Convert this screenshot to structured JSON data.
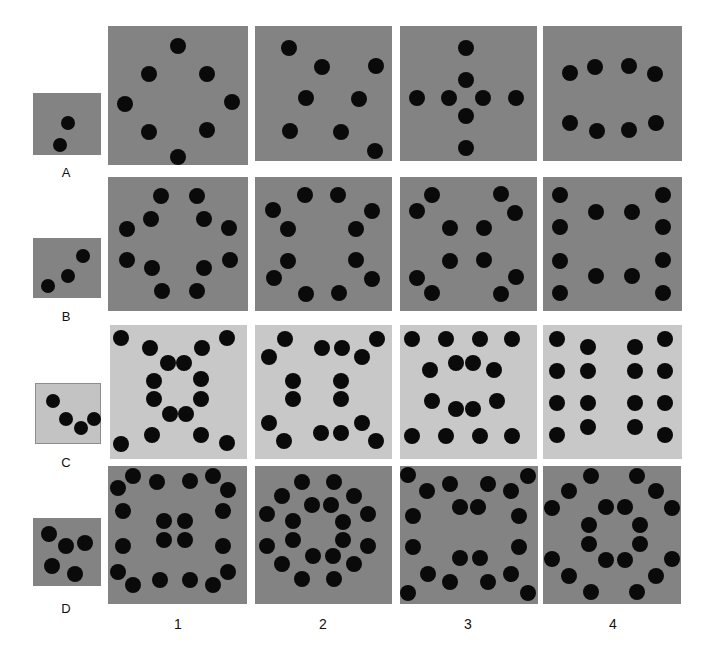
{
  "figure": {
    "width": 706,
    "height": 649,
    "background": "#ffffff",
    "dot_color": "#0a0a0a"
  },
  "row_labels": [
    {
      "id": "A",
      "label": "A",
      "x": 66,
      "y": 166
    },
    {
      "id": "B",
      "label": "B",
      "x": 66,
      "y": 310
    },
    {
      "id": "C",
      "label": "C",
      "x": 66,
      "y": 456
    },
    {
      "id": "D",
      "label": "D",
      "x": 66,
      "y": 602
    }
  ],
  "col_labels": [
    {
      "id": "1",
      "label": "1",
      "x": 178,
      "y": 617
    },
    {
      "id": "2",
      "label": "2",
      "x": 323,
      "y": 617
    },
    {
      "id": "3",
      "label": "3",
      "x": 468,
      "y": 617
    },
    {
      "id": "4",
      "label": "4",
      "x": 613,
      "y": 617
    }
  ],
  "panels": [
    {
      "id": "A-sample",
      "row": "A",
      "col": "sample",
      "x": 33,
      "y": 93,
      "w": 68,
      "h": 62,
      "bg": "#838383",
      "border": "none",
      "dot_r": 7,
      "count": 2,
      "dots": [
        [
          35,
          30
        ],
        [
          27,
          52
        ]
      ]
    },
    {
      "id": "A1",
      "row": "A",
      "col": "1",
      "x": 108,
      "y": 26,
      "w": 140,
      "h": 139,
      "bg": "#838383",
      "border": "none",
      "dot_r": 8,
      "count": 8,
      "dots": [
        [
          70,
          20
        ],
        [
          41,
          48
        ],
        [
          99,
          48
        ],
        [
          17,
          78
        ],
        [
          124,
          76
        ],
        [
          41,
          106
        ],
        [
          99,
          104
        ],
        [
          70,
          131
        ]
      ]
    },
    {
      "id": "A2",
      "row": "A",
      "col": "2",
      "x": 255,
      "y": 26,
      "w": 137,
      "h": 135,
      "bg": "#838383",
      "border": "none",
      "dot_r": 8,
      "count": 8,
      "dots": [
        [
          34,
          22
        ],
        [
          67,
          41
        ],
        [
          121,
          40
        ],
        [
          51,
          72
        ],
        [
          104,
          73
        ],
        [
          35,
          105
        ],
        [
          86,
          106
        ],
        [
          120,
          125
        ]
      ]
    },
    {
      "id": "A3",
      "row": "A",
      "col": "3",
      "x": 400,
      "y": 26,
      "w": 137,
      "h": 135,
      "bg": "#838383",
      "border": "none",
      "dot_r": 8,
      "count": 8,
      "dots": [
        [
          66,
          22
        ],
        [
          66,
          54
        ],
        [
          17,
          72
        ],
        [
          49,
          72
        ],
        [
          83,
          72
        ],
        [
          116,
          72
        ],
        [
          66,
          90
        ],
        [
          66,
          122
        ]
      ]
    },
    {
      "id": "A4",
      "row": "A",
      "col": "4",
      "x": 543,
      "y": 26,
      "w": 139,
      "h": 135,
      "bg": "#838383",
      "border": "none",
      "dot_r": 8,
      "count": 8,
      "dots": [
        [
          27,
          47
        ],
        [
          52,
          41
        ],
        [
          86,
          40
        ],
        [
          112,
          48
        ],
        [
          27,
          97
        ],
        [
          54,
          105
        ],
        [
          86,
          104
        ],
        [
          113,
          97
        ]
      ]
    },
    {
      "id": "B-sample",
      "row": "B",
      "col": "sample",
      "x": 33,
      "y": 238,
      "w": 68,
      "h": 60,
      "bg": "#838383",
      "border": "none",
      "dot_r": 7,
      "count": 3,
      "dots": [
        [
          50,
          18
        ],
        [
          35,
          38
        ],
        [
          15,
          48
        ]
      ]
    },
    {
      "id": "B1",
      "row": "B",
      "col": "1",
      "x": 108,
      "y": 177,
      "w": 140,
      "h": 134,
      "bg": "#838383",
      "border": "none",
      "dot_r": 8,
      "count": 12,
      "dots": [
        [
          53,
          19
        ],
        [
          89,
          19
        ],
        [
          43,
          42
        ],
        [
          96,
          42
        ],
        [
          19,
          52
        ],
        [
          121,
          51
        ],
        [
          19,
          83
        ],
        [
          122,
          83
        ],
        [
          44,
          91
        ],
        [
          96,
          91
        ],
        [
          54,
          114
        ],
        [
          89,
          114
        ]
      ]
    },
    {
      "id": "B2",
      "row": "B",
      "col": "2",
      "x": 255,
      "y": 177,
      "w": 137,
      "h": 134,
      "bg": "#838383",
      "border": "none",
      "dot_r": 8,
      "count": 12,
      "dots": [
        [
          50,
          18
        ],
        [
          83,
          18
        ],
        [
          18,
          33
        ],
        [
          117,
          34
        ],
        [
          33,
          52
        ],
        [
          101,
          52
        ],
        [
          33,
          84
        ],
        [
          101,
          83
        ],
        [
          19,
          101
        ],
        [
          117,
          102
        ],
        [
          51,
          117
        ],
        [
          84,
          116
        ]
      ]
    },
    {
      "id": "B3",
      "row": "B",
      "col": "3",
      "x": 400,
      "y": 177,
      "w": 137,
      "h": 134,
      "bg": "#838383",
      "border": "none",
      "dot_r": 8,
      "count": 12,
      "dots": [
        [
          32,
          18
        ],
        [
          101,
          17
        ],
        [
          17,
          34
        ],
        [
          115,
          36
        ],
        [
          50,
          51
        ],
        [
          84,
          51
        ],
        [
          50,
          84
        ],
        [
          84,
          83
        ],
        [
          17,
          101
        ],
        [
          116,
          100
        ],
        [
          32,
          116
        ],
        [
          101,
          117
        ]
      ]
    },
    {
      "id": "B4",
      "row": "B",
      "col": "4",
      "x": 543,
      "y": 177,
      "w": 139,
      "h": 134,
      "bg": "#838383",
      "border": "none",
      "dot_r": 8,
      "count": 12,
      "dots": [
        [
          17,
          18
        ],
        [
          120,
          18
        ],
        [
          53,
          35
        ],
        [
          89,
          35
        ],
        [
          17,
          50
        ],
        [
          120,
          50
        ],
        [
          17,
          84
        ],
        [
          120,
          83
        ],
        [
          53,
          99
        ],
        [
          89,
          99
        ],
        [
          17,
          116
        ],
        [
          120,
          116
        ]
      ]
    },
    {
      "id": "C-sample",
      "row": "C",
      "col": "sample",
      "x": 35,
      "y": 383,
      "w": 66,
      "h": 61,
      "bg": "#c3c3c3",
      "border": "1px solid #8d8d8d",
      "dot_r": 7,
      "count": 4,
      "dots": [
        [
          17,
          17
        ],
        [
          30,
          35
        ],
        [
          45,
          44
        ],
        [
          58,
          35
        ]
      ]
    },
    {
      "id": "C1",
      "row": "C",
      "col": "1",
      "x": 110,
      "y": 325,
      "w": 137,
      "h": 134,
      "bg": "#c8c8c8",
      "border": "none",
      "dot_r": 8,
      "count": 16,
      "dots": [
        [
          11,
          13
        ],
        [
          40,
          23
        ],
        [
          58,
          38
        ],
        [
          74,
          38
        ],
        [
          92,
          23
        ],
        [
          117,
          13
        ],
        [
          44,
          56
        ],
        [
          91,
          54
        ],
        [
          44,
          74
        ],
        [
          91,
          74
        ],
        [
          60,
          89
        ],
        [
          76,
          89
        ],
        [
          11,
          119
        ],
        [
          42,
          110
        ],
        [
          91,
          110
        ],
        [
          117,
          118
        ]
      ]
    },
    {
      "id": "C2",
      "row": "C",
      "col": "2",
      "x": 255,
      "y": 325,
      "w": 137,
      "h": 134,
      "bg": "#c8c8c8",
      "border": "none",
      "dot_r": 8,
      "count": 16,
      "dots": [
        [
          30,
          14
        ],
        [
          67,
          23
        ],
        [
          87,
          23
        ],
        [
          122,
          14
        ],
        [
          14,
          32
        ],
        [
          107,
          32
        ],
        [
          38,
          56
        ],
        [
          86,
          56
        ],
        [
          38,
          74
        ],
        [
          86,
          74
        ],
        [
          14,
          98
        ],
        [
          107,
          98
        ],
        [
          29,
          116
        ],
        [
          66,
          108
        ],
        [
          86,
          108
        ],
        [
          121,
          116
        ]
      ]
    },
    {
      "id": "C3",
      "row": "C",
      "col": "3",
      "x": 400,
      "y": 325,
      "w": 137,
      "h": 134,
      "bg": "#c8c8c8",
      "border": "none",
      "dot_r": 8,
      "count": 16,
      "dots": [
        [
          12,
          14
        ],
        [
          46,
          14
        ],
        [
          80,
          14
        ],
        [
          112,
          14
        ],
        [
          56,
          38
        ],
        [
          73,
          38
        ],
        [
          30,
          45
        ],
        [
          94,
          45
        ],
        [
          32,
          76
        ],
        [
          97,
          76
        ],
        [
          56,
          84
        ],
        [
          73,
          84
        ],
        [
          12,
          111
        ],
        [
          46,
          111
        ],
        [
          80,
          111
        ],
        [
          112,
          111
        ]
      ]
    },
    {
      "id": "C4",
      "row": "C",
      "col": "4",
      "x": 543,
      "y": 325,
      "w": 139,
      "h": 134,
      "bg": "#c8c8c8",
      "border": "none",
      "dot_r": 8,
      "count": 16,
      "dots": [
        [
          14,
          14
        ],
        [
          45,
          22
        ],
        [
          92,
          22
        ],
        [
          122,
          14
        ],
        [
          14,
          46
        ],
        [
          45,
          46
        ],
        [
          92,
          46
        ],
        [
          122,
          46
        ],
        [
          14,
          78
        ],
        [
          45,
          78
        ],
        [
          92,
          78
        ],
        [
          122,
          78
        ],
        [
          14,
          110
        ],
        [
          45,
          102
        ],
        [
          92,
          102
        ],
        [
          122,
          110
        ]
      ]
    },
    {
      "id": "D-sample",
      "row": "D",
      "col": "sample",
      "x": 33,
      "y": 518,
      "w": 68,
      "h": 68,
      "bg": "#838383",
      "border": "none",
      "dot_r": 8,
      "count": 5,
      "dots": [
        [
          16,
          16
        ],
        [
          33,
          28
        ],
        [
          52,
          25
        ],
        [
          19,
          48
        ],
        [
          42,
          56
        ]
      ]
    },
    {
      "id": "D1",
      "row": "D",
      "col": "1",
      "x": 108,
      "y": 466,
      "w": 139,
      "h": 138,
      "bg": "#838383",
      "border": "none",
      "dot_r": 8,
      "count": 20,
      "dots": [
        [
          25,
          10
        ],
        [
          49,
          16
        ],
        [
          82,
          15
        ],
        [
          105,
          10
        ],
        [
          10,
          22
        ],
        [
          120,
          24
        ],
        [
          15,
          45
        ],
        [
          115,
          45
        ],
        [
          56,
          55
        ],
        [
          77,
          55
        ],
        [
          56,
          74
        ],
        [
          77,
          74
        ],
        [
          15,
          80
        ],
        [
          115,
          80
        ],
        [
          10,
          106
        ],
        [
          120,
          106
        ],
        [
          25,
          119
        ],
        [
          52,
          114
        ],
        [
          82,
          114
        ],
        [
          105,
          119
        ]
      ]
    },
    {
      "id": "D2",
      "row": "D",
      "col": "2",
      "x": 255,
      "y": 466,
      "w": 137,
      "h": 138,
      "bg": "#838383",
      "border": "none",
      "dot_r": 8,
      "count": 20,
      "dots": [
        [
          47,
          16
        ],
        [
          79,
          16
        ],
        [
          27,
          30
        ],
        [
          99,
          30
        ],
        [
          57,
          39
        ],
        [
          76,
          39
        ],
        [
          12,
          48
        ],
        [
          113,
          48
        ],
        [
          38,
          55
        ],
        [
          88,
          56
        ],
        [
          12,
          80
        ],
        [
          113,
          80
        ],
        [
          38,
          74
        ],
        [
          88,
          74
        ],
        [
          58,
          90
        ],
        [
          78,
          90
        ],
        [
          27,
          98
        ],
        [
          99,
          98
        ],
        [
          47,
          113
        ],
        [
          79,
          113
        ]
      ]
    },
    {
      "id": "D3",
      "row": "D",
      "col": "3",
      "x": 400,
      "y": 466,
      "w": 138,
      "h": 138,
      "bg": "#838383",
      "border": "none",
      "dot_r": 8,
      "count": 20,
      "dots": [
        [
          8,
          9
        ],
        [
          27,
          25
        ],
        [
          50,
          18
        ],
        [
          88,
          18
        ],
        [
          111,
          25
        ],
        [
          128,
          10
        ],
        [
          13,
          50
        ],
        [
          119,
          50
        ],
        [
          60,
          41
        ],
        [
          78,
          41
        ],
        [
          13,
          81
        ],
        [
          119,
          81
        ],
        [
          60,
          92
        ],
        [
          80,
          92
        ],
        [
          28,
          108
        ],
        [
          111,
          108
        ],
        [
          8,
          127
        ],
        [
          50,
          116
        ],
        [
          88,
          116
        ],
        [
          128,
          127
        ]
      ]
    },
    {
      "id": "D4",
      "row": "D",
      "col": "4",
      "x": 543,
      "y": 466,
      "w": 138,
      "h": 138,
      "bg": "#838383",
      "border": "none",
      "dot_r": 8,
      "count": 20,
      "dots": [
        [
          48,
          10
        ],
        [
          94,
          10
        ],
        [
          26,
          25
        ],
        [
          113,
          25
        ],
        [
          9,
          42
        ],
        [
          129,
          42
        ],
        [
          63,
          41
        ],
        [
          82,
          41
        ],
        [
          46,
          59
        ],
        [
          97,
          59
        ],
        [
          46,
          78
        ],
        [
          97,
          78
        ],
        [
          9,
          93
        ],
        [
          129,
          93
        ],
        [
          63,
          94
        ],
        [
          82,
          94
        ],
        [
          26,
          110
        ],
        [
          113,
          110
        ],
        [
          48,
          126
        ],
        [
          94,
          126
        ]
      ]
    }
  ]
}
